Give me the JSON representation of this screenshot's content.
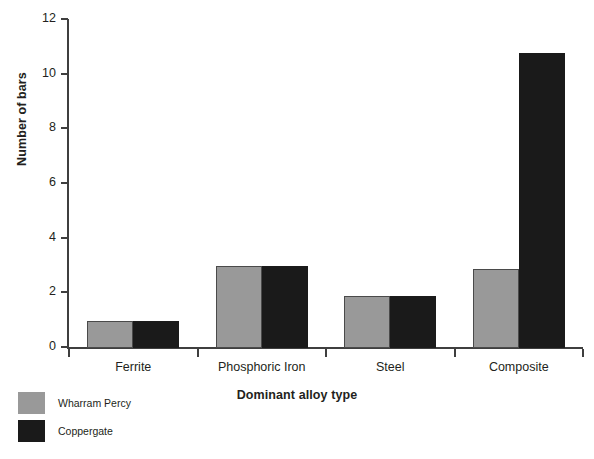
{
  "chart_data": {
    "type": "bar",
    "title": "",
    "xlabel": "Dominant alloy type",
    "ylabel": "Number of bars",
    "categories": [
      "Ferrite",
      "Phosphoric Iron",
      "Steel",
      "Composite"
    ],
    "series": [
      {
        "name": "Wharram Percy",
        "color": "#999999",
        "values": [
          1.0,
          3.0,
          1.9,
          2.9
        ]
      },
      {
        "name": "Coppergate",
        "color": "#1a1a1a",
        "values": [
          1.0,
          3.0,
          1.9,
          10.8
        ]
      }
    ],
    "ylim": [
      0,
      12
    ],
    "ytick_labels": [
      "0",
      "2",
      "4",
      "6",
      "8",
      "10",
      "12"
    ],
    "ytick_values": [
      0,
      2,
      4,
      6,
      8,
      10,
      12
    ],
    "grid": false,
    "legend_position": "bottom-left"
  },
  "axes": {
    "y_title": "Number of bars",
    "x_title": "Dominant alloy type"
  },
  "legend": {
    "entries": [
      {
        "label": "Wharram Percy",
        "swatch": "#999999"
      },
      {
        "label": "Coppergate",
        "swatch": "#1a1a1a"
      }
    ]
  }
}
